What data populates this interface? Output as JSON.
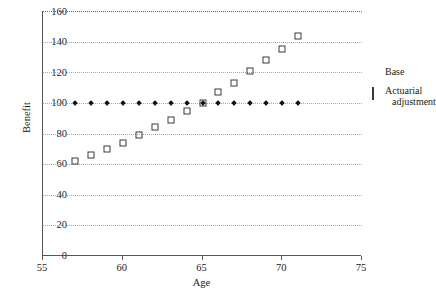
{
  "chart_data": {
    "type": "scatter",
    "title": "",
    "xlabel": "Age",
    "ylabel": "Benefit",
    "xlim": [
      55,
      75
    ],
    "ylim": [
      0,
      160
    ],
    "xticks": [
      55,
      60,
      65,
      70,
      75
    ],
    "yticks": [
      0,
      20,
      40,
      60,
      80,
      100,
      120,
      140,
      160
    ],
    "grid": true,
    "legend_position": "right",
    "x": [
      57,
      58,
      59,
      60,
      61,
      62,
      63,
      64,
      65,
      66,
      67,
      68,
      69,
      70,
      71
    ],
    "series": [
      {
        "name": "Base",
        "marker": "filled-diamond",
        "values": [
          100,
          100,
          100,
          100,
          100,
          100,
          100,
          100,
          100,
          100,
          100,
          100,
          100,
          100,
          100
        ]
      },
      {
        "name": "Actuarial adjustment",
        "marker": "open-square",
        "values": [
          62,
          66,
          70,
          74,
          79,
          84,
          89,
          95,
          100,
          107,
          113,
          121,
          128,
          135,
          144
        ]
      }
    ]
  },
  "axes": {
    "ylabel": "Benefit",
    "xlabel": "Age",
    "ytick_labels": [
      "160",
      "140",
      "120",
      "100",
      "80",
      "60",
      "40",
      "20",
      "0"
    ],
    "xtick_labels": [
      "55",
      "60",
      "65",
      "70",
      "75"
    ]
  },
  "legend": {
    "items": [
      {
        "label": "Base",
        "label_line2": "",
        "marker": "filled-diamond-icon"
      },
      {
        "label": "Actuarial",
        "label_line2": "adjustment",
        "marker": "open-square-icon"
      }
    ]
  }
}
